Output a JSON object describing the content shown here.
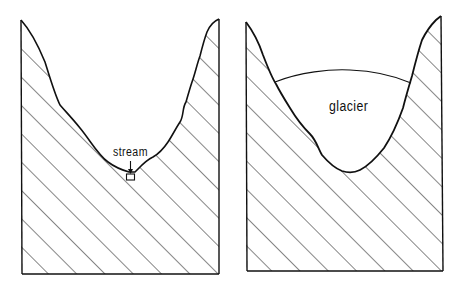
{
  "diagram": {
    "panels": [
      {
        "id": "stream-valley",
        "shape": "V-shaped valley",
        "label": "stream",
        "has_arrow": true
      },
      {
        "id": "glacier-valley",
        "shape": "U-shaped valley",
        "label": "glacier",
        "has_arrow": false
      }
    ],
    "colors": {
      "line": "#111111",
      "background": "#ffffff",
      "hatch": "#222222"
    }
  }
}
